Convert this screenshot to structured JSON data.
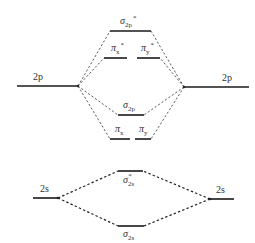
{
  "diagram": {
    "atomic_orbitals": {
      "left_2p": {
        "label": "2p",
        "x1": 17,
        "x2": 78,
        "y": 86
      },
      "right_2p": {
        "label": "2p",
        "x1": 184,
        "x2": 249,
        "y": 87
      },
      "left_2s": {
        "label": "2s",
        "x1": 33,
        "x2": 58,
        "y": 198
      },
      "right_2s": {
        "label": "2s",
        "x1": 210,
        "x2": 234,
        "y": 199
      }
    },
    "molecular_orbitals": {
      "sigma_2p_star": {
        "symbol": "σ",
        "sub": "2p",
        "sup": "*",
        "x1": 110,
        "x2": 151,
        "y": 31
      },
      "pi_x_star": {
        "symbol": "π",
        "sub": "x",
        "sup": "*",
        "x1": 104,
        "x2": 127,
        "y": 58
      },
      "pi_y_star": {
        "symbol": "π",
        "sub": "y",
        "sup": "*",
        "x1": 137,
        "x2": 160,
        "y": 58
      },
      "sigma_2p": {
        "symbol": "σ",
        "sub": "2p",
        "sup": "",
        "x1": 118,
        "x2": 144,
        "y": 115
      },
      "pi_x": {
        "symbol": "π",
        "sub": "x",
        "sup": "",
        "x1": 110,
        "x2": 130,
        "y": 139
      },
      "pi_y": {
        "symbol": "π",
        "sub": "y",
        "sup": "",
        "x1": 135,
        "x2": 151,
        "y": 139
      },
      "sigma_2s_star": {
        "symbol": "σ",
        "sub": "2s",
        "sup": "*",
        "x1": 118,
        "x2": 143,
        "y": 171
      },
      "sigma_2s": {
        "symbol": "σ",
        "sub": "2s",
        "sup": "",
        "x1": 118,
        "x2": 144,
        "y": 226
      }
    },
    "connections_note": "Dashed lines connect atomic orbitals to molecular orbitals"
  }
}
